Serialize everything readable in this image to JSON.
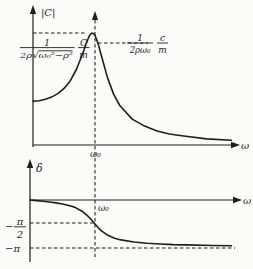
{
  "colors": {
    "ink": "#1e1e1e",
    "background": "#fbfbf9"
  },
  "top_chart": {
    "y_axis_label": "|C|",
    "x_axis_label": "ω",
    "x_tick_label": "ω₀",
    "peak_formula": {
      "numerator": "1",
      "denominator": "2ρ√ω₀²−ρ²",
      "factor_numerator": "C",
      "factor_denominator": "m"
    },
    "omega0_formula": {
      "numerator": "1",
      "denominator": "2ρω₀",
      "factor_numerator": "c",
      "factor_denominator": "m"
    }
  },
  "bottom_chart": {
    "y_axis_label": "δ",
    "x_axis_label": "ω",
    "x_tick_label": "ω₀",
    "half_pi_tick": {
      "sign": "−",
      "numerator": "π",
      "denominator": "2"
    },
    "pi_tick": "−π"
  },
  "chart_data": [
    {
      "type": "line",
      "name": "amplitude-resonance-curve",
      "title": "amplitude of forced oscillations vs driving frequency",
      "xlabel": "ω",
      "ylabel": "|C|",
      "x_unit": "ω/ω₀",
      "y_unit": "(C/m)/ω₀²",
      "x": [
        0,
        0.1,
        0.2,
        0.3,
        0.4,
        0.5,
        0.6,
        0.7,
        0.8,
        0.85,
        0.9,
        0.925,
        0.95,
        0.975,
        1.0,
        1.05,
        1.1,
        1.2,
        1.3,
        1.4,
        1.6,
        1.8,
        2.0,
        2.2,
        2.4,
        2.8,
        3.2
      ],
      "y": [
        1.0,
        1.01,
        1.04,
        1.09,
        1.17,
        1.29,
        1.46,
        1.72,
        2.08,
        2.28,
        2.46,
        2.52,
        2.55,
        2.54,
        2.5,
        2.31,
        2.05,
        1.54,
        1.16,
        0.9,
        0.59,
        0.43,
        0.32,
        0.25,
        0.21,
        0.14,
        0.11
      ],
      "peak": {
        "x": 0.96,
        "y": 2.55,
        "label": "1/(2ρ√ω₀²−ρ²) · C/m"
      },
      "value_at_omega0": {
        "x": 1.0,
        "y": 2.5,
        "label": "1/(2ρω₀) · c/m"
      },
      "x_marker": "ω₀",
      "grid": false,
      "legend": false
    },
    {
      "type": "line",
      "name": "phase-shift-curve",
      "title": "phase lag vs driving frequency",
      "xlabel": "ω",
      "ylabel": "δ",
      "x_unit": "ω/ω₀",
      "y_unit": "rad",
      "x": [
        0,
        0.1,
        0.2,
        0.3,
        0.4,
        0.5,
        0.6,
        0.7,
        0.8,
        0.9,
        0.95,
        1.0,
        1.05,
        1.1,
        1.2,
        1.3,
        1.4,
        1.6,
        1.8,
        2.0,
        2.2,
        2.4,
        2.8,
        3.1
      ],
      "y": [
        0,
        -0.04,
        -0.08,
        -0.13,
        -0.19,
        -0.26,
        -0.36,
        -0.5,
        -0.73,
        -1.09,
        -1.32,
        -1.57,
        -1.81,
        -2.02,
        -2.31,
        -2.5,
        -2.61,
        -2.75,
        -2.83,
        -2.88,
        -2.92,
        -2.94,
        -2.98,
        -3.0
      ],
      "y_ticks": [
        "−π/2",
        "−π"
      ],
      "value_at_omega0": -1.5708,
      "asymptote": -3.1416,
      "x_marker": "ω₀",
      "grid": false,
      "legend": false
    }
  ]
}
